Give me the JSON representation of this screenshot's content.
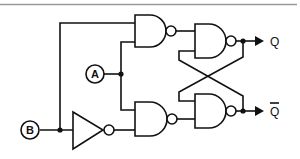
{
  "diagram": {
    "type": "logic-circuit",
    "inputs": [
      {
        "id": "A",
        "label": "A"
      },
      {
        "id": "B",
        "label": "B"
      }
    ],
    "outputs": [
      {
        "id": "Q",
        "label": "Q"
      },
      {
        "id": "Qbar",
        "label": "Q",
        "overline": true
      }
    ],
    "components": [
      {
        "id": "nand1",
        "type": "NAND",
        "inputs": [
          "B",
          "A"
        ],
        "output": "n1"
      },
      {
        "id": "nand2",
        "type": "NAND",
        "inputs": [
          "A",
          "not_B"
        ],
        "output": "n2"
      },
      {
        "id": "inv1",
        "type": "NOT",
        "inputs": [
          "B"
        ],
        "output": "not_B"
      },
      {
        "id": "nand3",
        "type": "NAND",
        "inputs": [
          "n1",
          "Qbar"
        ],
        "output": "Q"
      },
      {
        "id": "nand4",
        "type": "NAND",
        "inputs": [
          "Q",
          "n2"
        ],
        "output": "Qbar"
      }
    ],
    "colors": {
      "line": "#111111",
      "background": "#ffffff",
      "top_rule": "#9a9a9a"
    }
  }
}
